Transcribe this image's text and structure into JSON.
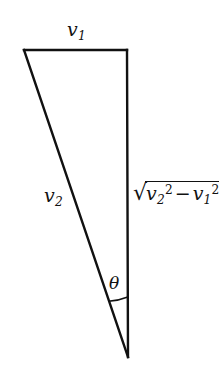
{
  "figure": {
    "type": "geometry-diagram",
    "shape": "right-triangle",
    "background_color": "#ffffff",
    "stroke_color": "#111111",
    "stroke_width": 2,
    "vertices": {
      "top_left": [
        24,
        50
      ],
      "top_right": [
        127,
        50
      ],
      "bottom": [
        128,
        357
      ]
    },
    "edges": [
      {
        "name": "top-horizontal",
        "label_ref": "v1",
        "from": "top_left",
        "to": "top_right"
      },
      {
        "name": "hypotenuse",
        "label_ref": "v2",
        "from": "top_left",
        "to": "bottom"
      },
      {
        "name": "right-vertical",
        "label_ref": "radical",
        "from": "top_right",
        "to": "bottom"
      }
    ],
    "angle_arc": {
      "at_vertex": "bottom",
      "label_ref": "theta",
      "radius": 60
    }
  },
  "labels": {
    "v1": {
      "variable": "v",
      "subscript": "1",
      "text": "v1"
    },
    "v2": {
      "variable": "v",
      "subscript": "2",
      "text": "v2"
    },
    "theta": {
      "symbol": "θ",
      "text": "θ"
    },
    "radical": {
      "text": "√(v2² − v1²)",
      "sign": "√",
      "first_variable": "v",
      "first_subscript": "2",
      "first_exponent": "2",
      "operator": "−",
      "second_variable": "v",
      "second_subscript": "1",
      "second_exponent": "2"
    }
  }
}
